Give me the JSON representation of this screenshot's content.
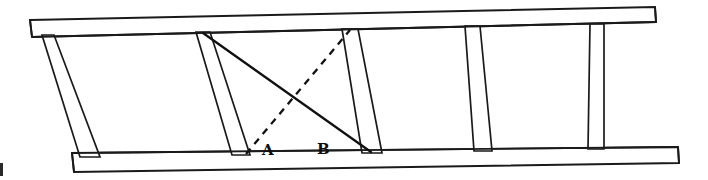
{
  "figure": {
    "background_color": "#ffffff",
    "line_color": "#1a1a1a",
    "width": 708,
    "height": 180
  },
  "labels": {
    "point_a": "A",
    "point_b": "B"
  },
  "geometry": {
    "top_rail": {
      "name": "top-rail",
      "outline_points": "30,20 655,7 656,22 32,37",
      "inner_line": "31,33 655,19"
    },
    "bottom_rail": {
      "name": "bottom-rail",
      "outline_points": "72,153 678,147 679,163 74,172",
      "inner_line": "73,163 678,155"
    },
    "rungs": [
      {
        "name": "rung-1",
        "points": "42,35 54,35 100,157 80,157"
      },
      {
        "name": "rung-2",
        "points": "196,32 210,32 250,155 232,155"
      },
      {
        "name": "rung-3",
        "points": "342,29 358,29 382,153 362,153"
      },
      {
        "name": "rung-4",
        "points": "465,26 480,26 492,151 474,151"
      },
      {
        "name": "rung-5",
        "points": "590,24 604,24 604,149 588,149"
      }
    ],
    "diagonal_solid": {
      "name": "diagonal-solid",
      "from": "203,33",
      "to": "371,152"
    },
    "diagonal_dashed": {
      "name": "diagonal-dashed",
      "from": "246,154",
      "to": "350,30"
    },
    "label_positions": {
      "a": {
        "x": 262,
        "y": 155
      },
      "b": {
        "x": 317,
        "y": 154
      }
    },
    "edge_speck": {
      "x": 0,
      "y": 163,
      "width": 3,
      "height": 13
    }
  }
}
